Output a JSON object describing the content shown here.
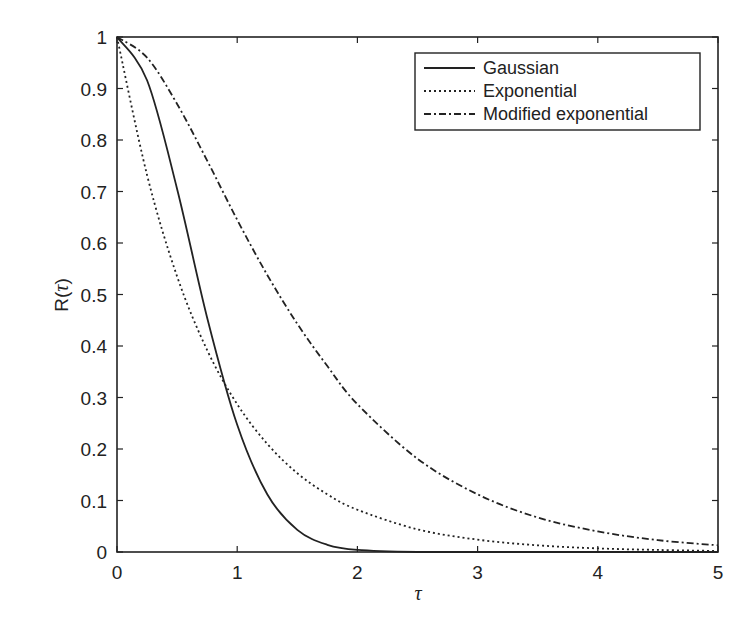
{
  "chart_data": {
    "type": "line",
    "title": "",
    "xlabel": "τ",
    "ylabel": "R(τ)",
    "xlim": [
      0,
      5
    ],
    "ylim": [
      0,
      1
    ],
    "grid": false,
    "legend_position": "upper right",
    "x_ticks": [
      "0",
      "1",
      "2",
      "3",
      "4",
      "5"
    ],
    "y_ticks": [
      "0",
      "0.1",
      "0.2",
      "0.3",
      "0.4",
      "0.5",
      "0.6",
      "0.7",
      "0.8",
      "0.9",
      "1"
    ],
    "x": [
      0,
      0.25,
      0.5,
      0.75,
      1.0,
      1.25,
      1.5,
      1.75,
      2.0,
      2.5,
      3.0,
      3.5,
      4.0,
      4.5,
      5.0
    ],
    "series": [
      {
        "name": "Gaussian",
        "style": "solid",
        "values": [
          1.0,
          0.916,
          0.705,
          0.455,
          0.247,
          0.112,
          0.043,
          0.014,
          0.004,
          0.0,
          0.0,
          0.0,
          0.0,
          0.0,
          0.0
        ]
      },
      {
        "name": "Exponential",
        "style": "dotted",
        "values": [
          1.0,
          0.732,
          0.535,
          0.392,
          0.287,
          0.21,
          0.153,
          0.112,
          0.082,
          0.044,
          0.024,
          0.013,
          0.007,
          0.004,
          0.002
        ]
      },
      {
        "name": "Modified exponential",
        "style": "dashdot",
        "values": [
          1.0,
          0.96,
          0.87,
          0.76,
          0.645,
          0.538,
          0.443,
          0.361,
          0.287,
          0.181,
          0.112,
          0.067,
          0.04,
          0.023,
          0.013
        ]
      }
    ]
  },
  "legend": {
    "items": [
      "Gaussian",
      "Exponential",
      "Modified exponential"
    ]
  },
  "axes": {
    "xlabel": "τ",
    "ylabel_main": "R(",
    "ylabel_var": "τ",
    "ylabel_close": ")"
  }
}
